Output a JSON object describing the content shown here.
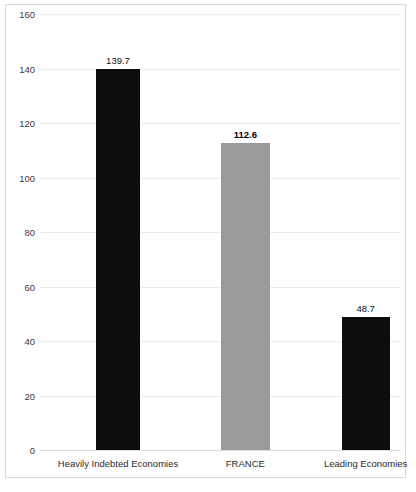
{
  "chart_data": {
    "type": "bar",
    "title": "",
    "subtitle": "",
    "xlabel": "",
    "ylabel": "",
    "categories": [
      "Heavily Indebted Economies",
      "FRANCE",
      "Leading Economies"
    ],
    "values": [
      139.7,
      112.6,
      48.7
    ],
    "value_labels": [
      "139.7",
      "112.6",
      "48.7"
    ],
    "bar_colors": [
      "#0d0d0d",
      "#9a9a9a",
      "#0d0d0d"
    ],
    "bar_label_bold": [
      false,
      true,
      false
    ],
    "ylim": [
      0,
      160
    ],
    "yticks": [
      0,
      20,
      40,
      60,
      80,
      100,
      120,
      140,
      160
    ],
    "ytick_labels": [
      "0",
      "20",
      "40",
      "60",
      "80",
      "100",
      "120",
      "140",
      "160"
    ],
    "grid": true,
    "legend": "none",
    "highlight_category": "FRANCE"
  },
  "colors": {
    "bar_dark": "#0d0d0d",
    "bar_gray": "#9a9a9a",
    "gridline": "#ececec",
    "frame": "#d9d9d9",
    "text": "#2a2a2a",
    "background": "#ffffff"
  }
}
